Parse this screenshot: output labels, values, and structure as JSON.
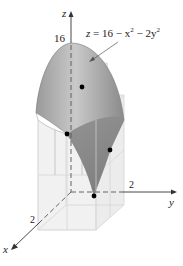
{
  "figure": {
    "equation": {
      "lhs": "z",
      "rhs": " = 16 − x",
      "exp1": "2",
      "mid": " − 2y",
      "exp2": "2"
    },
    "axes": {
      "z_label": "z",
      "y_label": "y",
      "x_label": "x",
      "z_tick": "16",
      "y_tick": "2",
      "x_tick": "2"
    },
    "points": [
      {
        "name": "upper-interior-point",
        "x": 82,
        "y": 87
      },
      {
        "name": "left-edge-point",
        "x": 67,
        "y": 134
      },
      {
        "name": "right-edge-point",
        "x": 110,
        "y": 150
      },
      {
        "name": "bottom-vertex-point",
        "x": 94,
        "y": 196
      }
    ],
    "colors": {
      "surface": "#8f8f8f",
      "surface_light": "#c8c8c8",
      "box": "#e4e4e4",
      "axis": "#333333"
    }
  }
}
